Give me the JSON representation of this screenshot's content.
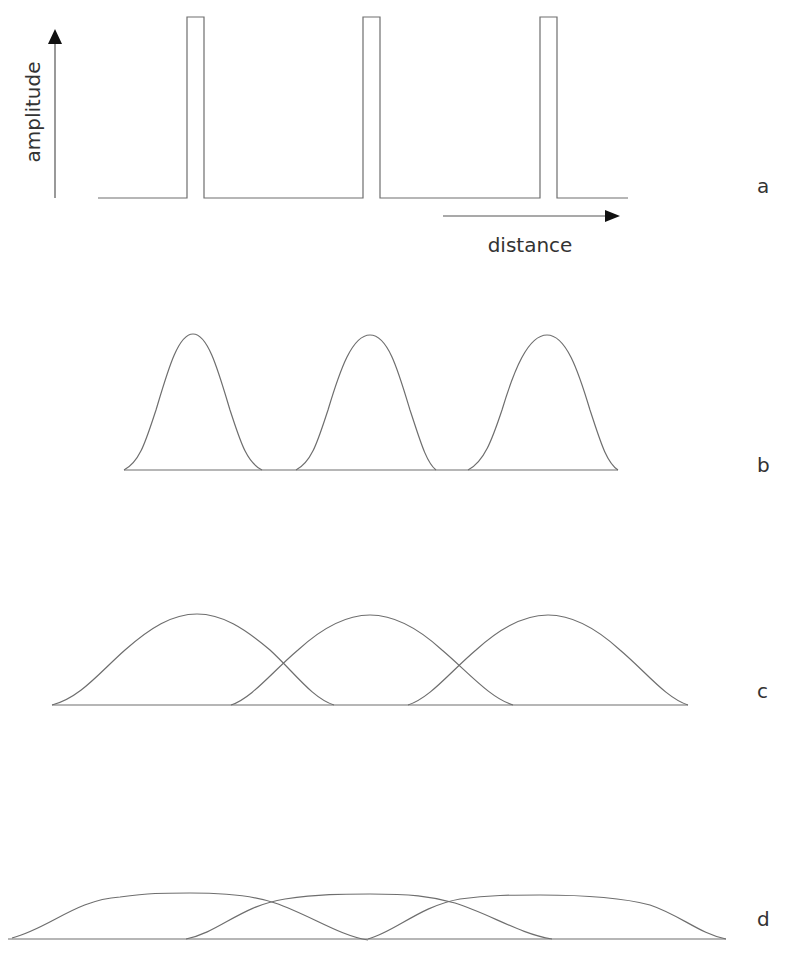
{
  "axes": {
    "y_label": "amplitude",
    "x_label": "distance"
  },
  "panels": [
    {
      "label": "a",
      "shape": "rectangular pulses",
      "peak_x": [
        195,
        371,
        548
      ],
      "width": 17
    },
    {
      "label": "b",
      "shape": "narrow gaussian-like bumps, separated",
      "peak_x": [
        193,
        370,
        547
      ]
    },
    {
      "label": "c",
      "shape": "wider bumps, overlapping",
      "peak_x": [
        197,
        370,
        548
      ]
    },
    {
      "label": "d",
      "shape": "broad flat bumps, heavily overlapping",
      "peak_x": [
        190,
        370,
        540
      ]
    }
  ],
  "colors": {
    "line": "#6e6e6e",
    "arrow": "#111111",
    "text": "#333333",
    "background": "#ffffff"
  }
}
